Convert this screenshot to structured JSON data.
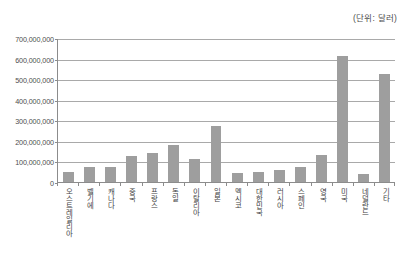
{
  "caption": {
    "unit_note": "(단위: 달러)"
  },
  "chart_data": {
    "type": "bar",
    "title": "",
    "subtitle": "",
    "xlabel": "",
    "ylabel": "",
    "unit_note": "(단위: 달러)",
    "ylim": [
      0,
      700000000
    ],
    "ytick_step": 100000000,
    "grid": true,
    "legend": "none",
    "bar_color": "#9e9e9e",
    "axis_color": "#8c8c8c",
    "gridline_color": "#a9a9a9",
    "ytick_labels": [
      "700,000,000",
      "600,000,000",
      "500,000,000",
      "400,000,000",
      "300,000,000",
      "200,000,000",
      "100,000,000",
      "0"
    ],
    "ytick_values": [
      700000000,
      600000000,
      500000000,
      400000000,
      300000000,
      200000000,
      100000000,
      0
    ],
    "categories": [
      "오스트레일리아",
      "벨기에",
      "캐나다",
      "중국",
      "프랑스",
      "독일",
      "이탈리아",
      "일본",
      "멕시코",
      "대한민국",
      "러시아",
      "스페인",
      "영국",
      "미국",
      "네덜란드",
      "기타"
    ],
    "values": [
      50000000,
      72000000,
      73000000,
      128000000,
      140000000,
      180000000,
      111000000,
      273000000,
      45000000,
      48000000,
      60000000,
      72000000,
      130000000,
      615000000,
      40000000,
      527000000
    ]
  }
}
